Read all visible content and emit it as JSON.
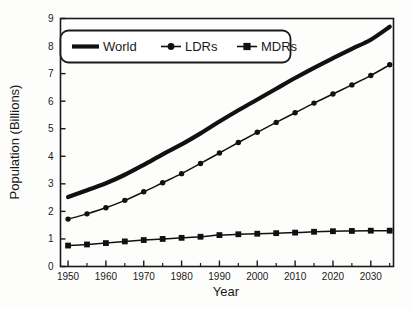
{
  "chart_data": {
    "type": "line",
    "title": "",
    "xlabel": "Year",
    "ylabel": "Population (Billions)",
    "xlim": [
      1948,
      2036
    ],
    "ylim": [
      0,
      9
    ],
    "grid": false,
    "legend_position": "top-left",
    "x": [
      1950,
      1955,
      1960,
      1965,
      1970,
      1975,
      1980,
      1985,
      1990,
      1995,
      2000,
      2005,
      2010,
      2015,
      2020,
      2025,
      2030,
      2035
    ],
    "xtick_labels": [
      "1950",
      "1960",
      "1970",
      "1980",
      "1990",
      "2000",
      "2010",
      "2020",
      "2030"
    ],
    "xtick_values": [
      1950,
      1960,
      1970,
      1980,
      1990,
      2000,
      2010,
      2020,
      2030
    ],
    "xminor_values": [
      1955,
      1965,
      1975,
      1985,
      1995,
      2005,
      2015,
      2025,
      2035
    ],
    "ytick_labels": [
      "0",
      "1",
      "2",
      "3",
      "4",
      "5",
      "6",
      "7",
      "8",
      "9"
    ],
    "ytick_values": [
      0,
      1,
      2,
      3,
      4,
      5,
      6,
      7,
      8,
      9
    ],
    "series": [
      {
        "name": "World",
        "marker": "none",
        "line_width": 4.2,
        "color": "#111111",
        "values": [
          2.52,
          2.77,
          3.02,
          3.33,
          3.69,
          4.07,
          4.43,
          4.83,
          5.26,
          5.67,
          6.06,
          6.45,
          6.84,
          7.21,
          7.56,
          7.9,
          8.23,
          8.7
        ]
      },
      {
        "name": "LDRs",
        "marker": "circle",
        "line_width": 1.5,
        "color": "#111111",
        "values": [
          1.72,
          1.91,
          2.13,
          2.4,
          2.71,
          3.04,
          3.37,
          3.74,
          4.12,
          4.5,
          4.87,
          5.23,
          5.58,
          5.93,
          6.26,
          6.59,
          6.93,
          7.32
        ]
      },
      {
        "name": "MDRs",
        "marker": "square",
        "line_width": 1.5,
        "color": "#111111",
        "values": [
          0.76,
          0.8,
          0.85,
          0.91,
          0.96,
          1.0,
          1.04,
          1.08,
          1.14,
          1.17,
          1.19,
          1.21,
          1.23,
          1.26,
          1.28,
          1.29,
          1.3,
          1.3
        ]
      }
    ]
  },
  "legend": {
    "entries": [
      {
        "label": "World",
        "marker": "none"
      },
      {
        "label": "LDRs",
        "marker": "circle"
      },
      {
        "label": "MDRs",
        "marker": "square"
      }
    ]
  },
  "colors": {
    "ink": "#111111",
    "background": "#fdfdfc",
    "frame": "#1a1a1a"
  }
}
